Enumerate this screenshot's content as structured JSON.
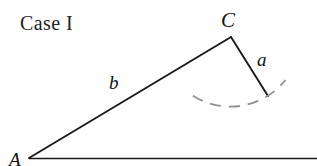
{
  "figure": {
    "title": "Case I",
    "background_color": "#fefefe",
    "stroke_color": "#1a1a1a",
    "arc_color": "#8a8a8a",
    "width": 317,
    "height": 166
  },
  "labels": {
    "case": "Case I",
    "vertex_c": "C",
    "vertex_a": "A",
    "side_a": "a",
    "side_b": "b"
  },
  "geometry": {
    "points": {
      "A": [
        29,
        158
      ],
      "C": [
        231,
        37
      ],
      "B_end_of_a": [
        268,
        96
      ],
      "baseline_right": [
        317,
        158
      ]
    },
    "segments": [
      {
        "name": "side-b-segment",
        "from": "A",
        "to": "C"
      },
      {
        "name": "side-a-segment",
        "from": "C",
        "to": "B_end_of_a"
      },
      {
        "name": "baseline-segment",
        "from": "A",
        "to": "baseline_right"
      }
    ],
    "arc": {
      "name": "swing-arc",
      "center": [
        231,
        37
      ],
      "radius": 70,
      "start_angle_deg": 123,
      "end_angle_deg": 39,
      "dashed": true
    }
  }
}
